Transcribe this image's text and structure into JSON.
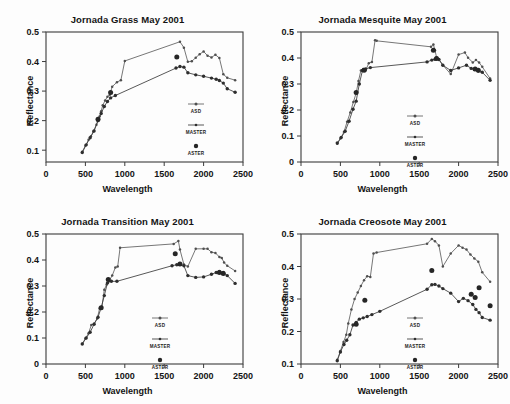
{
  "figure": {
    "axis_labels": {
      "x": "Wavelength",
      "y": "Reflectance"
    },
    "legend": {
      "asd": "ASD",
      "master": "MASTER",
      "aster": "ASTER"
    }
  },
  "chart_data": [
    {
      "type": "line",
      "title": "Jornada Grass May 2001",
      "xlabel": "Wavelength",
      "ylabel": "Reflectance",
      "xlim": [
        0,
        2500
      ],
      "ylim": [
        0.06,
        0.5
      ],
      "xticks": [
        0,
        500,
        1000,
        1500,
        2000,
        2500
      ],
      "yticks": [
        0.1,
        0.2,
        0.3,
        0.4,
        0.5
      ],
      "grid": false,
      "legend_position": "lower-right-inside",
      "series": [
        {
          "name": "ASD",
          "marker": "small-dot",
          "x": [
            460,
            500,
            540,
            570,
            600,
            640,
            680,
            700,
            720,
            750,
            780,
            810,
            840,
            900,
            950,
            1000,
            1700,
            1750,
            1800,
            1850,
            1900,
            1950,
            2000,
            2050,
            2100,
            2150,
            2200,
            2250,
            2300,
            2400
          ],
          "y": [
            0.095,
            0.115,
            0.135,
            0.147,
            0.163,
            0.186,
            0.214,
            0.232,
            0.252,
            0.268,
            0.281,
            0.288,
            0.315,
            0.33,
            0.337,
            0.402,
            0.467,
            0.447,
            0.399,
            0.401,
            0.413,
            0.425,
            0.434,
            0.42,
            0.414,
            0.423,
            0.412,
            0.357,
            0.345,
            0.337
          ]
        },
        {
          "name": "MASTER",
          "marker": "dot",
          "x": [
            460,
            510,
            560,
            610,
            660,
            700,
            740,
            780,
            820,
            880,
            1650,
            1700,
            1750,
            1800,
            1900,
            2000,
            2100,
            2160,
            2200,
            2250,
            2300,
            2400
          ],
          "y": [
            0.092,
            0.118,
            0.142,
            0.165,
            0.2,
            0.224,
            0.248,
            0.265,
            0.277,
            0.285,
            0.378,
            0.383,
            0.381,
            0.362,
            0.355,
            0.35,
            0.344,
            0.34,
            0.336,
            0.327,
            0.308,
            0.296
          ]
        },
        {
          "name": "ASTER",
          "marker": "large-dot",
          "x": [
            660,
            820,
            1660
          ],
          "y": [
            0.205,
            0.295,
            0.415
          ]
        }
      ]
    },
    {
      "type": "line",
      "title": "Jornada Mesquite May 2001",
      "xlabel": "Wavelength",
      "ylabel": "Reflectance",
      "xlim": [
        0,
        2500
      ],
      "ylim": [
        0.0,
        0.5
      ],
      "xticks": [
        0,
        500,
        1000,
        1500,
        2000,
        2500
      ],
      "yticks": [
        0,
        0.1,
        0.2,
        0.3,
        0.4,
        0.5
      ],
      "grid": false,
      "legend_position": "lower-center-inside",
      "series": [
        {
          "name": "ASD",
          "marker": "small-dot",
          "x": [
            460,
            500,
            545,
            585,
            625,
            665,
            700,
            730,
            760,
            790,
            820,
            860,
            900,
            940,
            960,
            1650,
            1680,
            1700,
            1720,
            1750,
            1800,
            1900,
            2000,
            2080,
            2120,
            2180,
            2220,
            2260,
            2300,
            2400
          ],
          "y": [
            0.07,
            0.09,
            0.115,
            0.155,
            0.19,
            0.231,
            0.265,
            0.312,
            0.352,
            0.358,
            0.352,
            0.38,
            0.385,
            0.468,
            0.466,
            0.443,
            0.452,
            0.43,
            0.403,
            0.395,
            0.373,
            0.338,
            0.413,
            0.421,
            0.401,
            0.383,
            0.392,
            0.383,
            0.366,
            0.321
          ]
        },
        {
          "name": "MASTER",
          "marker": "dot",
          "x": [
            460,
            510,
            560,
            610,
            660,
            700,
            740,
            780,
            820,
            880,
            1600,
            1660,
            1700,
            1750,
            1800,
            1900,
            2000,
            2100,
            2160,
            2200,
            2250,
            2300,
            2400
          ],
          "y": [
            0.073,
            0.094,
            0.118,
            0.157,
            0.203,
            0.234,
            0.3,
            0.352,
            0.358,
            0.363,
            0.385,
            0.392,
            0.395,
            0.394,
            0.372,
            0.352,
            0.362,
            0.372,
            0.36,
            0.356,
            0.35,
            0.345,
            0.314
          ]
        },
        {
          "name": "ASTER",
          "marker": "large-dot",
          "x": [
            700,
            800,
            1680,
            1720,
            2210,
            2250
          ],
          "y": [
            0.267,
            0.353,
            0.43,
            0.398,
            0.358,
            0.353
          ]
        }
      ]
    },
    {
      "type": "line",
      "title": "Jornada Transition May 2001",
      "xlabel": "Wavelength",
      "ylabel": "Reflectance",
      "xlim": [
        0,
        2500
      ],
      "ylim": [
        0.0,
        0.5
      ],
      "xticks": [
        0,
        500,
        1000,
        1500,
        2000,
        2500
      ],
      "yticks": [
        0,
        0.1,
        0.2,
        0.3,
        0.4,
        0.5
      ],
      "grid": false,
      "legend_position": "lower-center-inside",
      "series": [
        {
          "name": "ASD",
          "marker": "small-dot",
          "x": [
            460,
            500,
            540,
            575,
            610,
            650,
            680,
            710,
            740,
            770,
            800,
            840,
            880,
            910,
            940,
            1620,
            1680,
            1700,
            1750,
            1800,
            1900,
            2000,
            2050,
            2100,
            2150,
            2200,
            2230,
            2260,
            2300,
            2400
          ],
          "y": [
            0.078,
            0.098,
            0.118,
            0.15,
            0.155,
            0.175,
            0.213,
            0.22,
            0.286,
            0.306,
            0.32,
            0.34,
            0.371,
            0.375,
            0.447,
            0.462,
            0.473,
            0.44,
            0.383,
            0.375,
            0.443,
            0.443,
            0.443,
            0.43,
            0.427,
            0.412,
            0.408,
            0.39,
            0.378,
            0.358
          ]
        },
        {
          "name": "MASTER",
          "marker": "dot",
          "x": [
            460,
            510,
            560,
            610,
            660,
            700,
            740,
            780,
            830,
            900,
            1600,
            1660,
            1700,
            1750,
            1800,
            1900,
            2000,
            2100,
            2160,
            2200,
            2250,
            2300,
            2400
          ],
          "y": [
            0.077,
            0.1,
            0.122,
            0.153,
            0.18,
            0.216,
            0.263,
            0.312,
            0.318,
            0.318,
            0.378,
            0.382,
            0.383,
            0.378,
            0.34,
            0.333,
            0.335,
            0.345,
            0.352,
            0.356,
            0.352,
            0.34,
            0.31
          ]
        },
        {
          "name": "ASTER",
          "marker": "large-dot",
          "x": [
            700,
            790,
            1640,
            1700,
            2200,
            2250
          ],
          "y": [
            0.216,
            0.325,
            0.424,
            0.385,
            0.352,
            0.348
          ]
        }
      ]
    },
    {
      "type": "line",
      "title": "Jornada Creosote May 2001",
      "xlabel": "Wavelength",
      "ylabel": "Reflectance",
      "xlim": [
        0,
        2500
      ],
      "ylim": [
        0.1,
        0.5
      ],
      "xticks": [
        0,
        500,
        1000,
        1500,
        2000,
        2500
      ],
      "yticks": [
        0.1,
        0.2,
        0.3,
        0.4,
        0.5
      ],
      "grid": false,
      "legend_position": "lower-center-inside",
      "series": [
        {
          "name": "ASD",
          "marker": "small-dot",
          "x": [
            460,
            500,
            540,
            575,
            600,
            640,
            680,
            720,
            760,
            800,
            840,
            880,
            920,
            960,
            1600,
            1660,
            1700,
            1750,
            1800,
            1900,
            2000,
            2050,
            2100,
            2150,
            2200,
            2250,
            2300,
            2400
          ],
          "y": [
            0.113,
            0.14,
            0.168,
            0.19,
            0.225,
            0.268,
            0.3,
            0.32,
            0.34,
            0.358,
            0.37,
            0.368,
            0.44,
            0.443,
            0.47,
            0.485,
            0.478,
            0.465,
            0.4,
            0.44,
            0.465,
            0.458,
            0.452,
            0.437,
            0.425,
            0.415,
            0.382,
            0.353
          ]
        },
        {
          "name": "MASTER",
          "marker": "dot",
          "x": [
            460,
            500,
            545,
            580,
            620,
            660,
            700,
            740,
            790,
            840,
            900,
            1000,
            1600,
            1660,
            1700,
            1750,
            1800,
            1900,
            2000,
            2060,
            2120,
            2180,
            2220,
            2260,
            2300,
            2400
          ],
          "y": [
            0.11,
            0.137,
            0.16,
            0.173,
            0.19,
            0.22,
            0.228,
            0.238,
            0.242,
            0.246,
            0.252,
            0.262,
            0.33,
            0.344,
            0.345,
            0.34,
            0.332,
            0.318,
            0.292,
            0.302,
            0.295,
            0.283,
            0.268,
            0.258,
            0.243,
            0.235
          ]
        },
        {
          "name": "ASTER",
          "marker": "large-dot",
          "x": [
            700,
            810,
            1660,
            2160,
            2210,
            2260,
            2400
          ],
          "y": [
            0.222,
            0.296,
            0.388,
            0.315,
            0.305,
            0.335,
            0.279
          ]
        }
      ]
    }
  ]
}
